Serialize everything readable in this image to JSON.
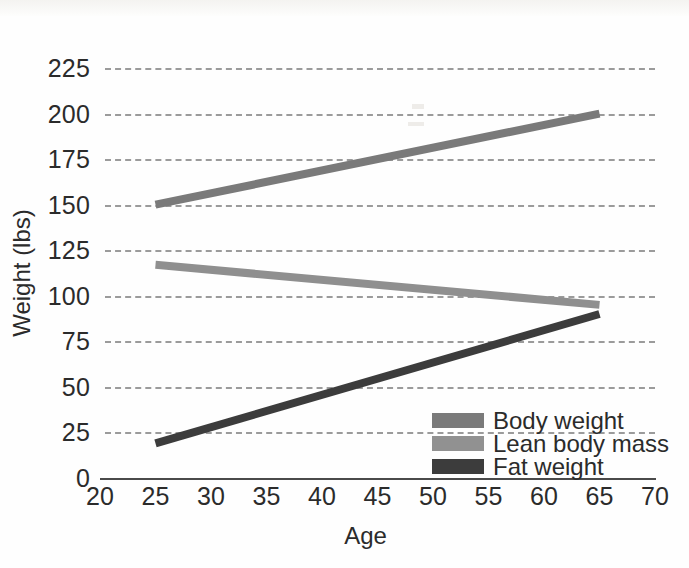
{
  "chart_data": {
    "type": "line",
    "title": "",
    "subtitle": "",
    "xlabel": "Age",
    "ylabel": "Weight (lbs)",
    "xlim": [
      20,
      70
    ],
    "ylim": [
      0,
      225
    ],
    "xticks": [
      20,
      25,
      30,
      35,
      40,
      45,
      50,
      55,
      60,
      65,
      70
    ],
    "yticks": [
      0,
      25,
      50,
      75,
      100,
      125,
      150,
      175,
      200,
      225
    ],
    "xtick_labels": [
      "20",
      "25",
      "30",
      "35",
      "40",
      "45",
      "50",
      "55",
      "60",
      "65",
      "70"
    ],
    "ytick_labels": [
      "0",
      "25",
      "50",
      "75",
      "100",
      "125",
      "150",
      "175",
      "200",
      "225"
    ],
    "grid": "horizontal-dashed",
    "legend_position": "lower-right-inside",
    "x": [
      25,
      65
    ],
    "series": [
      {
        "name": "Body weight",
        "values": [
          150,
          200
        ],
        "color": "#7a7a7a"
      },
      {
        "name": "Lean body mass",
        "values": [
          117,
          95
        ],
        "color": "#8f8f8f"
      },
      {
        "name": "Fat weight",
        "values": [
          19,
          90
        ],
        "color": "#3c3c3c"
      }
    ]
  },
  "axes": {
    "y_title": "Weight (lbs)",
    "x_title": "Age"
  },
  "legend": {
    "items": [
      {
        "label": "Body weight",
        "color": "#7a7a7a"
      },
      {
        "label": "Lean body mass",
        "color": "#919191"
      },
      {
        "label": "Fat weight",
        "color": "#3c3c3c"
      }
    ]
  },
  "colors": {
    "background": "#fefefe",
    "grid": "#9b9b9b",
    "axis": "#4a4a4a",
    "text": "#2b2b2b",
    "body_weight": "#7a7a7a",
    "lean_body_mass": "#919191",
    "fat_weight": "#3c3c3c"
  }
}
